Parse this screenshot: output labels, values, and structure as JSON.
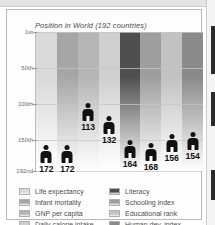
{
  "chart_data": {
    "type": "bar",
    "title": "Position in World (192 countries)",
    "xlabel": "",
    "ylabel": "",
    "ylim": [
      1,
      192
    ],
    "grid": true,
    "legend_position": "bottom",
    "ytick_labels": [
      "1st",
      "50th",
      "100th",
      "150th",
      "192nd"
    ],
    "ytick_values": [
      1,
      50,
      100,
      150,
      192
    ],
    "categories": [
      "Life expectancy",
      "Infant mortality",
      "GNP per capita",
      "Daily calorie intake",
      "Literacy",
      "Schooling index",
      "Educational rank",
      "Human dev. index"
    ],
    "values": [
      172,
      172,
      113,
      132,
      164,
      168,
      156,
      154
    ],
    "value_labels": [
      "172",
      "172",
      "113",
      "132",
      "164",
      "168",
      "156",
      "154"
    ],
    "colors": [
      "#d9d9d9",
      "#a6a6a6",
      "#b5b5b5",
      "#cfcfcf",
      "#4f4f4f",
      "#9e9e9e",
      "#c2c2c2",
      "#8a8a8a"
    ]
  },
  "legend": {
    "left_column": [
      {
        "label": "Life expectancy",
        "color": "#d9d9d9"
      },
      {
        "label": "Infant mortality",
        "color": "#a6a6a6"
      },
      {
        "label": "GNP per capita",
        "color": "#b5b5b5"
      },
      {
        "label": "Daily calorie intake",
        "color": "#cfcfcf"
      }
    ],
    "right_column": [
      {
        "label": "Literacy",
        "color": "#4f4f4f"
      },
      {
        "label": "Schooling index",
        "color": "#9e9e9e"
      },
      {
        "label": "Educational rank",
        "color": "#c2c2c2"
      },
      {
        "label": "Human dev. index",
        "color": "#8a8a8a"
      }
    ]
  }
}
